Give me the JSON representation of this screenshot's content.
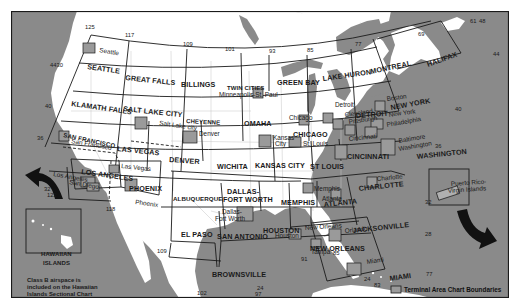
{
  "map": {
    "title": "Sectional and Terminal Area Chart Index",
    "colors": {
      "water": "#8a8a8a",
      "land": "#ffffff",
      "tac_box": "#9a9a9a",
      "lines": "#1a1a1a",
      "state_lines": "#bdbdbd"
    },
    "sectional_charts": [
      {
        "id": "seattle",
        "label": "SEATTLE"
      },
      {
        "id": "great-falls",
        "label": "GREAT FALLS"
      },
      {
        "id": "billings",
        "label": "BILLINGS"
      },
      {
        "id": "twin-cities",
        "label": "TWIN CITIES"
      },
      {
        "id": "green-bay",
        "label": "GREEN BAY"
      },
      {
        "id": "lake-huron",
        "label": "LAKE HURON"
      },
      {
        "id": "montreal",
        "label": "MONTREAL"
      },
      {
        "id": "halifax",
        "label": "HALIFAX"
      },
      {
        "id": "klamath-falls",
        "label": "KLAMATH FALLS"
      },
      {
        "id": "salt-lake-city",
        "label": "SALT LAKE CITY"
      },
      {
        "id": "cheyenne",
        "label": "CHEYENNE"
      },
      {
        "id": "omaha",
        "label": "OMAHA"
      },
      {
        "id": "chicago",
        "label": "CHICAGO"
      },
      {
        "id": "detroit",
        "label": "DETROIT"
      },
      {
        "id": "new-york",
        "label": "NEW YORK"
      },
      {
        "id": "san-francisco",
        "label": "SAN FRANCISCO"
      },
      {
        "id": "las-vegas",
        "label": "LAS VEGAS"
      },
      {
        "id": "denver",
        "label": "DENVER"
      },
      {
        "id": "wichita",
        "label": "WICHITA"
      },
      {
        "id": "kansas-city",
        "label": "KANSAS CITY"
      },
      {
        "id": "st-louis",
        "label": "ST LOUIS"
      },
      {
        "id": "cincinnati",
        "label": "CINCINNATI"
      },
      {
        "id": "washington",
        "label": "WASHINGTON"
      },
      {
        "id": "los-angeles",
        "label": "LOS ANGELES"
      },
      {
        "id": "phoenix",
        "label": "PHOENIX"
      },
      {
        "id": "albuquerque",
        "label": "ALBUQUERQUE"
      },
      {
        "id": "dallas-fort-worth",
        "label": "DALLAS-",
        "label2": "FORT WORTH"
      },
      {
        "id": "memphis",
        "label": "MEMPHIS"
      },
      {
        "id": "atlanta",
        "label": "ATLANTA"
      },
      {
        "id": "charlotte",
        "label": "CHARLOTTE"
      },
      {
        "id": "el-paso",
        "label": "EL PASO"
      },
      {
        "id": "san-antonio",
        "label": "SAN ANTONIO"
      },
      {
        "id": "houston",
        "label": "HOUSTON"
      },
      {
        "id": "new-orleans",
        "label": "NEW ORLEANS"
      },
      {
        "id": "jacksonville",
        "label": "JACKSONVILLE"
      },
      {
        "id": "brownsville",
        "label": "BROWNSVILLE"
      },
      {
        "id": "miami",
        "label": "MIAMI"
      },
      {
        "id": "hawaiian-islands",
        "label": "HAWAIIAN",
        "label2": "ISLANDS"
      }
    ],
    "terminal_area_charts": [
      {
        "id": "seattle",
        "label": "Seattle"
      },
      {
        "id": "minneapolis",
        "label": "Minneapolis-St. Paul"
      },
      {
        "id": "salt-lake",
        "label": "Salt Lake city"
      },
      {
        "id": "denver",
        "label": "Denver"
      },
      {
        "id": "san-francisco",
        "label": "San Francisco"
      },
      {
        "id": "las-vegas",
        "label": "Las Vegas"
      },
      {
        "id": "los-angeles",
        "label": "Los Angeles"
      },
      {
        "id": "san-diego",
        "label": "San Diego"
      },
      {
        "id": "phoenix",
        "label": "Phoenix"
      },
      {
        "id": "dallas",
        "label": "Dallas-",
        "label2": "Fort Worth"
      },
      {
        "id": "kansas-city",
        "label": "Kansas",
        "label2": "City"
      },
      {
        "id": "st-louis",
        "label": "St. Louis"
      },
      {
        "id": "chicago",
        "label": "Chicago"
      },
      {
        "id": "detroit",
        "label": "Detroit"
      },
      {
        "id": "cleveland",
        "label": "Cleveland"
      },
      {
        "id": "pittsburgh",
        "label": "Pittsburgh"
      },
      {
        "id": "cincinnati",
        "label": "Cincinnati"
      },
      {
        "id": "boston",
        "label": "Boston"
      },
      {
        "id": "new-york",
        "label": "New York"
      },
      {
        "id": "philadelphia",
        "label": "Philadelphia"
      },
      {
        "id": "baltimore",
        "label": "Baltimore"
      },
      {
        "id": "washington",
        "label": "Washington"
      },
      {
        "id": "charlotte",
        "label": "Charlotte"
      },
      {
        "id": "memphis",
        "label": "Memphis"
      },
      {
        "id": "atlanta",
        "label": "Atlanta"
      },
      {
        "id": "houston",
        "label": "Houston"
      },
      {
        "id": "new-orleans",
        "label": "New Orleans"
      },
      {
        "id": "orlando",
        "label": "Orlando"
      },
      {
        "id": "tampa",
        "label": "Tampa"
      },
      {
        "id": "miami",
        "label": "Miami"
      },
      {
        "id": "puerto-rico",
        "label": "Puerto Rico-",
        "label2": "Virgin Islands"
      }
    ],
    "coordinates": {
      "lon_top": [
        "125",
        "117",
        "109",
        "101",
        "93",
        "85",
        "77",
        "69",
        "61",
        "48"
      ],
      "lat_left": [
        "4430",
        "40",
        "36",
        "32"
      ],
      "lon_left_bottom": "122",
      "lat_right": [
        "44",
        "40",
        "36",
        "32",
        "28"
      ],
      "bottom": [
        "118",
        "109",
        "102",
        "97",
        "24",
        "91",
        "85",
        "24",
        "83",
        "77"
      ]
    },
    "notes": {
      "hawaii_line1": "Class B airspace is",
      "hawaii_line2": "included on the Hawaiian",
      "hawaii_line3": "Islands Sectional Chart",
      "legend": "Terminal Area Chart Boundaries"
    }
  }
}
